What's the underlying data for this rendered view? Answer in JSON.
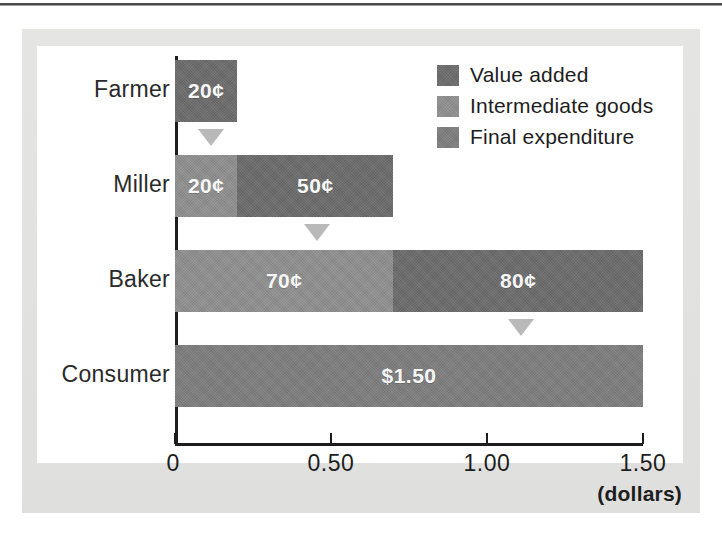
{
  "figure": {
    "axis_title": "(dollars)"
  },
  "legend": {
    "items": [
      {
        "label": "Value added",
        "key": "value_added",
        "color": "#6b6b6b"
      },
      {
        "label": "Intermediate goods",
        "key": "intermediate",
        "color": "#8e8e8e"
      },
      {
        "label": "Final expenditure",
        "key": "final_expenditure",
        "color": "#7d7d7d"
      }
    ]
  },
  "axis": {
    "ticks": [
      {
        "label": "0",
        "value": 0
      },
      {
        "label": "0.50",
        "value": 0.5
      },
      {
        "label": "1.00",
        "value": 1.0
      },
      {
        "label": "1.50",
        "value": 1.5
      }
    ]
  },
  "rows": [
    {
      "category": "Farmer",
      "segments": [
        {
          "series": "Value added",
          "label": "20¢",
          "value": 0.2,
          "color": "#6b6b6b"
        }
      ],
      "marker_value": 0.2
    },
    {
      "category": "Miller",
      "segments": [
        {
          "series": "Intermediate goods",
          "label": "20¢",
          "value": 0.2,
          "color": "#8e8e8e"
        },
        {
          "series": "Value added",
          "label": "50¢",
          "value": 0.5,
          "color": "#6b6b6b"
        }
      ],
      "marker_value": 0.7
    },
    {
      "category": "Baker",
      "segments": [
        {
          "series": "Intermediate goods",
          "label": "70¢",
          "value": 0.7,
          "color": "#8e8e8e"
        },
        {
          "series": "Value added",
          "label": "80¢",
          "value": 0.8,
          "color": "#6b6b6b"
        }
      ],
      "marker_value": 1.5
    },
    {
      "category": "Consumer",
      "segments": [
        {
          "series": "Final expenditure",
          "label": "$1.50",
          "value": 1.5,
          "color": "#7d7d7d"
        }
      ],
      "marker_value": null
    }
  ],
  "chart_data": {
    "type": "bar",
    "orientation": "horizontal",
    "stacked": true,
    "title": "",
    "subtitle": "",
    "xlabel": "(dollars)",
    "ylabel": "",
    "categories": [
      "Farmer",
      "Miller",
      "Baker",
      "Consumer"
    ],
    "xlim": [
      0,
      1.5
    ],
    "xticks": [
      0,
      0.5,
      1.0,
      1.5
    ],
    "xticklabels": [
      "0",
      "0.50",
      "1.00",
      "1.50"
    ],
    "grid": false,
    "legend_position": "top-right",
    "series": [
      {
        "name": "Intermediate goods",
        "color": "#8e8e8e",
        "values": [
          0,
          0.2,
          0.7,
          0
        ]
      },
      {
        "name": "Value added",
        "color": "#6b6b6b",
        "values": [
          0.2,
          0.5,
          0.8,
          0
        ]
      },
      {
        "name": "Final expenditure",
        "color": "#7d7d7d",
        "values": [
          0,
          0,
          0,
          1.5
        ]
      }
    ],
    "data_labels": {
      "Farmer": [
        "20¢"
      ],
      "Miller": [
        "20¢",
        "50¢"
      ],
      "Baker": [
        "70¢",
        "80¢"
      ],
      "Consumer": [
        "$1.50"
      ]
    },
    "totals": [
      0.2,
      0.7,
      1.5,
      1.5
    ],
    "annotations": [
      {
        "type": "down-triangle",
        "at_value": 0.2,
        "after_category": "Farmer",
        "color": "#b9b9b9"
      },
      {
        "type": "down-triangle",
        "at_value": 0.7,
        "after_category": "Miller",
        "color": "#b9b9b9"
      },
      {
        "type": "down-triangle",
        "at_value": 1.5,
        "after_category": "Baker",
        "color": "#b9b9b9"
      }
    ]
  }
}
